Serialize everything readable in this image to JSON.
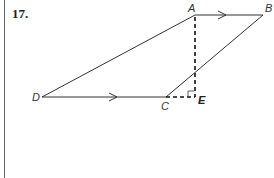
{
  "problem": {
    "number": "17."
  },
  "diagram": {
    "type": "trapezoid",
    "points": {
      "A": {
        "label": "A",
        "x": 195,
        "y": 15
      },
      "B": {
        "label": "B",
        "x": 263,
        "y": 15
      },
      "C": {
        "label": "C",
        "x": 166,
        "y": 97
      },
      "D": {
        "label": "D",
        "x": 42,
        "y": 97
      },
      "E": {
        "label": "E",
        "x": 195,
        "y": 97
      }
    },
    "segments": [
      {
        "from": "A",
        "to": "B",
        "style": "solid",
        "arrow": true
      },
      {
        "from": "D",
        "to": "C",
        "style": "solid",
        "arrow": true
      },
      {
        "from": "D",
        "to": "A",
        "style": "solid"
      },
      {
        "from": "C",
        "to": "B",
        "style": "solid"
      },
      {
        "from": "A",
        "to": "E",
        "style": "dashed",
        "note": "altitude"
      },
      {
        "from": "C",
        "to": "E",
        "style": "dashed",
        "note": "extension of DC"
      }
    ],
    "right_angle_at": "E",
    "parallel_marks": [
      "AB",
      "DC"
    ],
    "colors": {
      "line": "#333333",
      "dashed": "#111111"
    }
  }
}
